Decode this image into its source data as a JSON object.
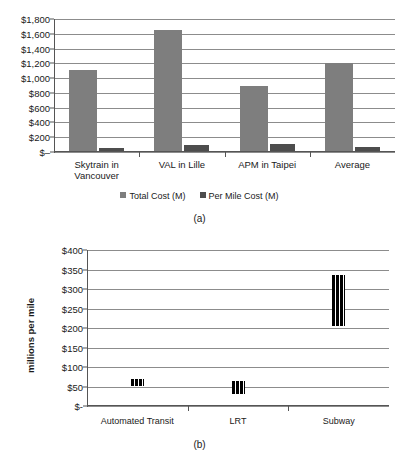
{
  "figure": {
    "caption_a": "(a)",
    "caption_b": "(b)"
  },
  "chart_data": [
    {
      "type": "bar",
      "panel": "(a)",
      "title": "",
      "xlabel": "",
      "ylabel": "",
      "categories": [
        "Skytrain in\nVancouver",
        "VAL in Lille",
        "APM in Taipei",
        "Average"
      ],
      "series": [
        {
          "name": "Total Cost (M)",
          "color": "#7e7e7e",
          "values": [
            1110,
            1650,
            900,
            1205
          ]
        },
        {
          "name": "Per Mile Cost (M)",
          "color": "#4d4d4d",
          "values": [
            55,
            95,
            110,
            70
          ]
        }
      ],
      "ylim": [
        0,
        1800
      ],
      "ytick_values": [
        1800,
        1600,
        1400,
        1200,
        1000,
        800,
        600,
        400,
        200,
        0
      ],
      "ytick_labels": [
        "$1,800",
        "$1,600",
        "$1,400",
        "$1,200",
        "$1,000",
        "$800",
        "$600",
        "$400",
        "$200",
        "$–"
      ],
      "grid": true,
      "legend_position": "bottom"
    },
    {
      "type": "bar",
      "panel": "(b)",
      "title": "",
      "xlabel": "",
      "ylabel": "millions per mile",
      "categories": [
        "Automated Transit",
        "LRT",
        "Subway"
      ],
      "series": [
        {
          "name": "Cost range per mile",
          "color": "#000000",
          "ranges": [
            {
              "low": 50,
              "high": 70
            },
            {
              "low": 32,
              "high": 65
            },
            {
              "low": 205,
              "high": 337
            }
          ]
        }
      ],
      "ylim": [
        0,
        400
      ],
      "ytick_values": [
        400,
        350,
        300,
        250,
        200,
        150,
        100,
        50,
        0
      ],
      "ytick_labels": [
        "$400",
        "$350",
        "$300",
        "$250",
        "$200",
        "$150",
        "$100",
        "$50",
        "$-"
      ],
      "grid": true,
      "legend_position": "none"
    }
  ]
}
